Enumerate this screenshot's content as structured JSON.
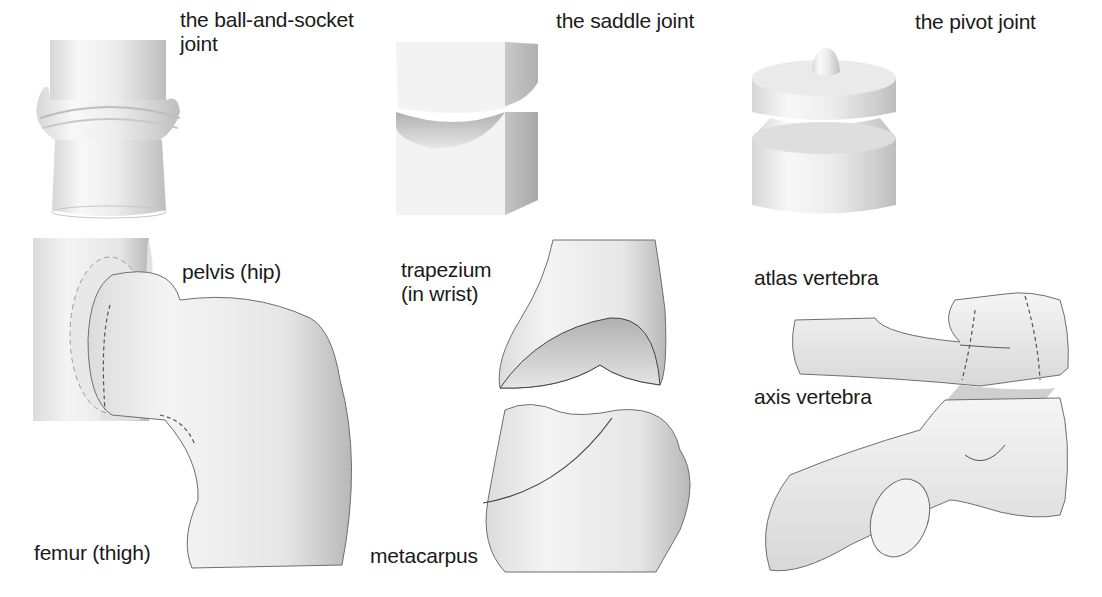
{
  "diagram": {
    "columns": [
      {
        "joint_model": {
          "label": "the ball-and-socket\njoint",
          "icon": "ball-and-socket-joint-model"
        },
        "anatomy": {
          "labels": {
            "upper": "pelvis (hip)",
            "lower": "femur (thigh)"
          },
          "icon": "hip-joint-illustration"
        }
      },
      {
        "joint_model": {
          "label": "the saddle joint",
          "icon": "saddle-joint-model"
        },
        "anatomy": {
          "labels": {
            "upper": "trapezium\n(in wrist)",
            "lower": "metacarpus"
          },
          "icon": "thumb-joint-illustration"
        }
      },
      {
        "joint_model": {
          "label": "the pivot joint",
          "icon": "pivot-joint-model"
        },
        "anatomy": {
          "labels": {
            "upper": "atlas vertebra",
            "lower": "axis vertebra"
          },
          "icon": "neck-vertebrae-illustration"
        }
      }
    ],
    "colors": {
      "ink": "#1a1a1a",
      "shade_light": "#f2f2f2",
      "shade_mid": "#cfcfcf",
      "shade_dark": "#9a9a9a"
    }
  }
}
